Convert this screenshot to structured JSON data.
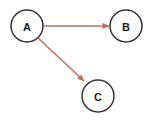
{
  "diagram": {
    "type": "directed-graph",
    "canvas": {
      "width": 153,
      "height": 124,
      "background_color": "#ffffff"
    },
    "style": {
      "node_stroke_color": "#333333",
      "node_fill_color": "#ffffff",
      "node_stroke_width": 1.5,
      "node_radius": 16,
      "node_label_color": "#1a1a1a",
      "node_label_size": 11,
      "edge_color": "#c0705a",
      "edge_stroke_width": 1.6,
      "arrowhead_length": 7,
      "arrowhead_width": 6
    },
    "nodes": [
      {
        "id": "A",
        "label": "A",
        "cx": 27,
        "cy": 26
      },
      {
        "id": "B",
        "label": "B",
        "cx": 126,
        "cy": 26
      },
      {
        "id": "C",
        "label": "C",
        "cx": 98,
        "cy": 96
      }
    ],
    "edges": [
      {
        "id": "A-B",
        "label": "",
        "source": "A",
        "target": "B",
        "directed": true,
        "x1": 44,
        "y1": 26,
        "x2": 109,
        "y2": 26
      },
      {
        "id": "A-C",
        "label": "",
        "source": "A",
        "target": "C",
        "directed": true,
        "x1": 38,
        "y1": 38,
        "x2": 84,
        "y2": 81
      }
    ]
  }
}
